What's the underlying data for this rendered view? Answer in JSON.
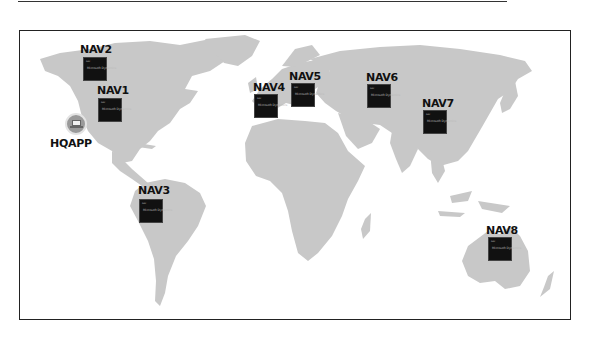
{
  "diagram": {
    "type": "world-map-deployment",
    "map_color": "#c8c8c8",
    "tile_color": "#111111",
    "tile_brand_text": "Microsoft Dynamics",
    "tile_tag_text": "NAV",
    "hq": {
      "label": "HQAPP",
      "icon": "laptop-icon"
    },
    "nodes": [
      {
        "label": "NAV1",
        "region": "North America (east)"
      },
      {
        "label": "NAV2",
        "region": "North America (Canada)"
      },
      {
        "label": "NAV3",
        "region": "South America"
      },
      {
        "label": "NAV4",
        "region": "Western Europe"
      },
      {
        "label": "NAV5",
        "region": "Eastern Europe"
      },
      {
        "label": "NAV6",
        "region": "Russia"
      },
      {
        "label": "NAV7",
        "region": "China"
      },
      {
        "label": "NAV8",
        "region": "Australia"
      }
    ]
  }
}
